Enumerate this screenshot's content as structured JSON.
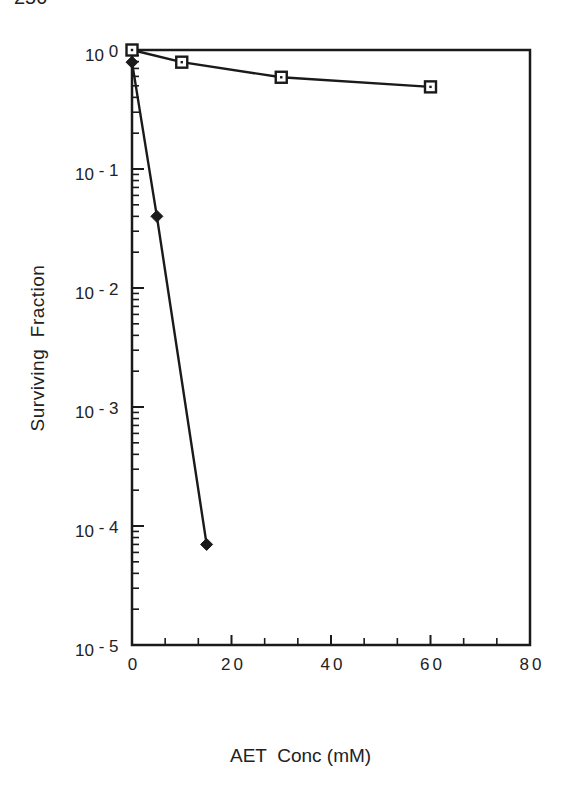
{
  "page": {
    "number_fragment": "250"
  },
  "chart_data": {
    "type": "line",
    "title": "",
    "xlabel": "AET  Conc (mM)",
    "ylabel": "Surviving  Fraction",
    "xlim": [
      0,
      80
    ],
    "ylim": [
      1e-05,
      1
    ],
    "yscale": "log",
    "grid": false,
    "legend": null,
    "x_ticks": [
      0,
      20,
      40,
      60,
      80
    ],
    "x_tick_labels": [
      "0",
      "20",
      "40",
      "60",
      "80"
    ],
    "y_ticks": [
      1,
      0.1,
      0.01,
      0.001,
      0.0001,
      1e-05
    ],
    "y_tick_labels": [
      {
        "base": "10",
        "exp": "0"
      },
      {
        "base": "10",
        "exp": "- 1"
      },
      {
        "base": "10",
        "exp": "- 2"
      },
      {
        "base": "10",
        "exp": "- 3"
      },
      {
        "base": "10",
        "exp": "- 4"
      },
      {
        "base": "10",
        "exp": "- 5"
      }
    ],
    "series": [
      {
        "name": "open squares",
        "marker": "open-square",
        "x": [
          0,
          10,
          30,
          60
        ],
        "y": [
          1.0,
          0.79,
          0.59,
          0.49
        ]
      },
      {
        "name": "filled diamonds",
        "marker": "filled-diamond",
        "x": [
          0,
          5,
          15
        ],
        "y": [
          0.79,
          0.04,
          7e-05
        ]
      }
    ]
  },
  "colors": {
    "ink": "#1a1a1a",
    "background": "#ffffff"
  }
}
